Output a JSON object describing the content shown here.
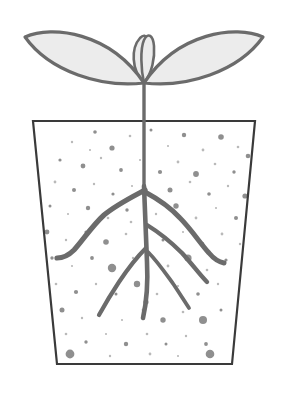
{
  "illustration": {
    "title": "Seedling in pot with root system",
    "subject": "seedling-plant",
    "background_color": "#ffffff",
    "canvas": {
      "width": 286,
      "height": 399
    }
  },
  "colors": {
    "outline": "#6b6b6b",
    "leaf_fill": "#ececec",
    "pot_outline": "#3a3a3a",
    "pot_fill": "#ffffff",
    "soil_dot": "#8f8f8f",
    "soil_dot_light": "#b9b9b9",
    "root": "#6b6b6b",
    "stem": "#6b6b6b"
  },
  "parts": {
    "leaf_left": {
      "name": "left cotyledon leaf",
      "tip_x": 25,
      "tip_y": 37,
      "base_x": 144,
      "base_y": 83,
      "path": "M25,37 C52,25 110,32 144,83 C102,88 50,72 25,37 Z"
    },
    "leaf_right": {
      "name": "right cotyledon leaf",
      "tip_x": 263,
      "tip_y": 37,
      "base_x": 144,
      "base_y": 83,
      "path": "M263,37 C236,25 178,32 144,83 C186,88 238,72 263,37 Z"
    },
    "bud_left": {
      "name": "left bud petal",
      "path": "M144,83 C131,70 131,48 140,38 C147,31 150,42 149,55 C148,66 147,75 144,83 Z"
    },
    "bud_right": {
      "name": "right bud petal",
      "path": "M144,83 C152,73 155,58 154,46 C153,35 148,32 144,40 C140,49 141,70 144,83 Z"
    },
    "stem": {
      "name": "stem",
      "top_y": 83,
      "bottom_y": 186,
      "x": 144,
      "width": 3.4
    },
    "taproot": {
      "name": "main taproot",
      "path": "M144,186 C145,215 146,242 147,262 C148,282 147,300 143,318"
    },
    "pot": {
      "name": "plant pot",
      "top_left_x": 33,
      "top_left_y": 121,
      "top_right_x": 255,
      "top_right_y": 121,
      "bottom_right_x": 232,
      "bottom_right_y": 364,
      "bottom_left_x": 57,
      "bottom_left_y": 364,
      "stroke_width": 2.2
    },
    "roots": [
      {
        "name": "upper-left lateral root",
        "path": "M145,190 C130,198 116,205 104,215 C92,226 83,240 74,250 C68,256 62,258 57,258",
        "width": 5.2
      },
      {
        "name": "upper-right lateral root",
        "path": "M145,192 C158,199 170,207 180,218 C191,229 200,243 209,253 C214,259 219,262 224,263",
        "width": 5.0
      },
      {
        "name": "mid-right lateral root",
        "path": "M147,225 C160,233 172,243 182,253 C192,264 200,275 207,282",
        "width": 4.4
      },
      {
        "name": "lower-right lateral root",
        "path": "M148,252 C158,262 166,274 174,285 C180,294 185,302 189,308",
        "width": 3.8
      },
      {
        "name": "lower-left lateral root",
        "path": "M146,248 C136,258 127,270 119,282 C111,294 104,306 99,315",
        "width": 4.2
      }
    ],
    "soil_dots": [
      {
        "cx": 72,
        "cy": 142,
        "r": 1.2
      },
      {
        "cx": 95,
        "cy": 132,
        "r": 1.8
      },
      {
        "cx": 112,
        "cy": 148,
        "r": 2.6
      },
      {
        "cx": 130,
        "cy": 136,
        "r": 1.3
      },
      {
        "cx": 151,
        "cy": 130,
        "r": 1.5
      },
      {
        "cx": 168,
        "cy": 146,
        "r": 1.1
      },
      {
        "cx": 184,
        "cy": 135,
        "r": 2.2
      },
      {
        "cx": 203,
        "cy": 150,
        "r": 1.4
      },
      {
        "cx": 221,
        "cy": 137,
        "r": 2.8
      },
      {
        "cx": 238,
        "cy": 147,
        "r": 1.3
      },
      {
        "cx": 60,
        "cy": 160,
        "r": 1.6
      },
      {
        "cx": 83,
        "cy": 166,
        "r": 2.4
      },
      {
        "cx": 101,
        "cy": 158,
        "r": 1.2
      },
      {
        "cx": 121,
        "cy": 170,
        "r": 1.9
      },
      {
        "cx": 140,
        "cy": 160,
        "r": 1.1
      },
      {
        "cx": 160,
        "cy": 172,
        "r": 2.1
      },
      {
        "cx": 178,
        "cy": 162,
        "r": 1.4
      },
      {
        "cx": 196,
        "cy": 174,
        "r": 2.9
      },
      {
        "cx": 215,
        "cy": 164,
        "r": 1.3
      },
      {
        "cx": 234,
        "cy": 172,
        "r": 1.7
      },
      {
        "cx": 248,
        "cy": 156,
        "r": 2.3
      },
      {
        "cx": 55,
        "cy": 182,
        "r": 1.4
      },
      {
        "cx": 74,
        "cy": 190,
        "r": 2.0
      },
      {
        "cx": 94,
        "cy": 184,
        "r": 1.2
      },
      {
        "cx": 113,
        "cy": 194,
        "r": 1.6
      },
      {
        "cx": 132,
        "cy": 186,
        "r": 1.1
      },
      {
        "cx": 170,
        "cy": 190,
        "r": 2.5
      },
      {
        "cx": 190,
        "cy": 182,
        "r": 1.3
      },
      {
        "cx": 209,
        "cy": 194,
        "r": 1.8
      },
      {
        "cx": 228,
        "cy": 186,
        "r": 1.2
      },
      {
        "cx": 245,
        "cy": 196,
        "r": 2.6
      },
      {
        "cx": 50,
        "cy": 206,
        "r": 1.5
      },
      {
        "cx": 68,
        "cy": 214,
        "r": 1.1
      },
      {
        "cx": 88,
        "cy": 208,
        "r": 2.2
      },
      {
        "cx": 108,
        "cy": 218,
        "r": 1.3
      },
      {
        "cx": 127,
        "cy": 210,
        "r": 1.7
      },
      {
        "cx": 156,
        "cy": 214,
        "r": 1.2
      },
      {
        "cx": 176,
        "cy": 206,
        "r": 2.7
      },
      {
        "cx": 196,
        "cy": 218,
        "r": 1.4
      },
      {
        "cx": 216,
        "cy": 208,
        "r": 1.1
      },
      {
        "cx": 236,
        "cy": 218,
        "r": 2.0
      },
      {
        "cx": 47,
        "cy": 232,
        "r": 2.4
      },
      {
        "cx": 66,
        "cy": 240,
        "r": 1.2
      },
      {
        "cx": 86,
        "cy": 232,
        "r": 1.6
      },
      {
        "cx": 106,
        "cy": 242,
        "r": 2.8
      },
      {
        "cx": 126,
        "cy": 234,
        "r": 1.3
      },
      {
        "cx": 163,
        "cy": 240,
        "r": 1.5
      },
      {
        "cx": 183,
        "cy": 232,
        "r": 1.1
      },
      {
        "cx": 202,
        "cy": 244,
        "r": 2.3
      },
      {
        "cx": 222,
        "cy": 234,
        "r": 1.4
      },
      {
        "cx": 240,
        "cy": 244,
        "r": 1.2
      },
      {
        "cx": 52,
        "cy": 258,
        "r": 1.7
      },
      {
        "cx": 72,
        "cy": 266,
        "r": 1.1
      },
      {
        "cx": 92,
        "cy": 258,
        "r": 1.9
      },
      {
        "cx": 112,
        "cy": 268,
        "r": 4.2
      },
      {
        "cx": 133,
        "cy": 258,
        "r": 1.2
      },
      {
        "cx": 168,
        "cy": 266,
        "r": 1.4
      },
      {
        "cx": 188,
        "cy": 258,
        "r": 3.6
      },
      {
        "cx": 207,
        "cy": 270,
        "r": 1.3
      },
      {
        "cx": 226,
        "cy": 260,
        "r": 1.6
      },
      {
        "cx": 56,
        "cy": 284,
        "r": 1.3
      },
      {
        "cx": 76,
        "cy": 292,
        "r": 2.1
      },
      {
        "cx": 96,
        "cy": 284,
        "r": 1.2
      },
      {
        "cx": 116,
        "cy": 294,
        "r": 1.5
      },
      {
        "cx": 137,
        "cy": 284,
        "r": 3.2
      },
      {
        "cx": 157,
        "cy": 294,
        "r": 1.3
      },
      {
        "cx": 178,
        "cy": 286,
        "r": 1.1
      },
      {
        "cx": 198,
        "cy": 294,
        "r": 1.8
      },
      {
        "cx": 218,
        "cy": 284,
        "r": 1.2
      },
      {
        "cx": 62,
        "cy": 310,
        "r": 2.5
      },
      {
        "cx": 82,
        "cy": 318,
        "r": 1.2
      },
      {
        "cx": 102,
        "cy": 310,
        "r": 1.6
      },
      {
        "cx": 122,
        "cy": 320,
        "r": 1.1
      },
      {
        "cx": 143,
        "cy": 310,
        "r": 1.4
      },
      {
        "cx": 163,
        "cy": 320,
        "r": 2.7
      },
      {
        "cx": 183,
        "cy": 312,
        "r": 1.3
      },
      {
        "cx": 203,
        "cy": 320,
        "r": 4.0
      },
      {
        "cx": 221,
        "cy": 310,
        "r": 1.5
      },
      {
        "cx": 66,
        "cy": 334,
        "r": 1.3
      },
      {
        "cx": 86,
        "cy": 342,
        "r": 1.7
      },
      {
        "cx": 106,
        "cy": 334,
        "r": 1.1
      },
      {
        "cx": 126,
        "cy": 344,
        "r": 2.2
      },
      {
        "cx": 147,
        "cy": 334,
        "r": 1.3
      },
      {
        "cx": 166,
        "cy": 344,
        "r": 1.5
      },
      {
        "cx": 186,
        "cy": 336,
        "r": 1.2
      },
      {
        "cx": 206,
        "cy": 344,
        "r": 1.9
      },
      {
        "cx": 70,
        "cy": 354,
        "r": 4.4
      },
      {
        "cx": 110,
        "cy": 356,
        "r": 1.2
      },
      {
        "cx": 150,
        "cy": 354,
        "r": 1.4
      },
      {
        "cx": 178,
        "cy": 356,
        "r": 1.1
      },
      {
        "cx": 210,
        "cy": 354,
        "r": 4.3
      },
      {
        "cx": 146,
        "cy": 302,
        "r": 2.6
      },
      {
        "cx": 131,
        "cy": 222,
        "r": 1.3
      },
      {
        "cx": 90,
        "cy": 150,
        "r": 1.1
      }
    ]
  }
}
